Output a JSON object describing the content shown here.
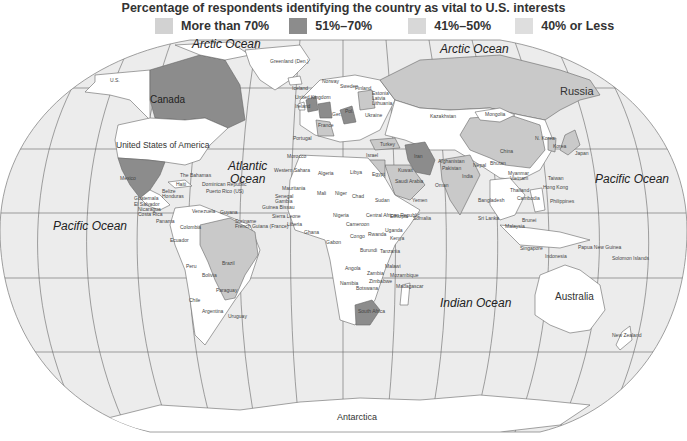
{
  "title": "Percentage of respondents identifying the country as vital to U.S. interests",
  "legend": [
    {
      "label": "More than 70%",
      "color": "#d2d2d2"
    },
    {
      "label": "51%–70%",
      "color": "#8c8c8c"
    },
    {
      "label": "41%–50%",
      "color": "#d8d8d8"
    },
    {
      "label": "40% or Less",
      "color": "#dedede"
    }
  ],
  "colors": {
    "ocean": "#ececec",
    "land": "#ffffff",
    "dark": "#8c8c8c",
    "light": "#c9c9c9",
    "grid": "#555555"
  },
  "oceans": {
    "arctic_w": "Arctic Ocean",
    "arctic_e": "Arctic Ocean",
    "atlantic_1": "Atlantic",
    "atlantic_2": "Ocean",
    "pacific_w": "Pacific Ocean",
    "pacific_e": "Pacific Ocean",
    "indian": "Indian Ocean"
  },
  "continents": {
    "antarctica": "Antarctica",
    "australia": "Australia"
  },
  "countries": {
    "canada": "Canada",
    "usa": "United States of America",
    "us_alaska": "U.S.",
    "russia": "Russia",
    "mexico": "Mexico",
    "brazil": "Brazil",
    "greenland": "Greenland (Den.)",
    "iceland": "Iceland",
    "norway": "Norway",
    "uk": "United Kingdom",
    "ireland": "Ireland",
    "france": "France",
    "portugal": "Portugal",
    "morocco": "Morocco",
    "algeria": "Algeria",
    "libya": "Libya",
    "egypt": "Egypt",
    "turkey": "Turkey",
    "iran": "Iran",
    "israel": "Israel",
    "saudi": "Saudi Arabia",
    "kuwait": "Kuwait",
    "oman": "Oman",
    "afghanistan": "Afghanistan",
    "pakistan": "Pakistan",
    "india": "India",
    "nepal": "Nepal",
    "bhutan": "Bhutan",
    "bangladesh": "Bangladesh",
    "sri_lanka": "Sri Lanka",
    "china": "China",
    "mongolia": "Mongolia",
    "kazakhstan": "Kazakhstan",
    "n_korea": "N. Korea",
    "s_korea": "Korea",
    "japan": "Japan",
    "taiwan": "Taiwan",
    "hong_kong": "Hong Kong",
    "myanmar": "Myanmar",
    "vietnam": "Vietnam",
    "thailand": "Thailand",
    "cambodia": "Cambodia",
    "philippines": "Philippines",
    "malaysia": "Malaysia",
    "brunei": "Brunei",
    "singapore": "Singapore",
    "indonesia": "Indonesia",
    "png": "Papua New Guinea",
    "solomon": "Solomon Islands",
    "new_zealand": "New Zealand",
    "bahamas": "The Bahamas",
    "cuba": "Cuba",
    "haiti": "Haiti",
    "dominican": "Dominican Republic",
    "puerto_rico": "Puerto Rico (US)",
    "belize": "Belize",
    "honduras": "Honduras",
    "guatemala": "Guatemala",
    "el_salvador": "El Salvador",
    "nicaragua": "Nicaragua",
    "costa_rica": "Costa Rica",
    "panama": "Panama",
    "venezuela": "Venezuela",
    "guyana": "Guyana",
    "suriname": "Suriname",
    "french_guiana": "French Guiana (France)",
    "colombia": "Colombia",
    "ecuador": "Ecuador",
    "peru": "Peru",
    "bolivia": "Bolivia",
    "paraguay": "Paraguay",
    "chile": "Chile",
    "argentina": "Argentina",
    "uruguay": "Uruguay",
    "western_sahara": "Western Sahara",
    "mauritania": "Mauritania",
    "senegal": "Senegal",
    "gambia": "Gambia",
    "guinea_bissau": "Guinea Bissau",
    "sierra_leone": "Sierra Leone",
    "liberia": "Liberia",
    "ivory_coast": "Ivory Coast",
    "ghana": "Ghana",
    "mali": "Mali",
    "niger": "Niger",
    "nigeria": "Nigeria",
    "chad": "Chad",
    "sudan": "Sudan",
    "ethiopia": "Ethiopia",
    "somalia": "Somalia",
    "car": "Central African Republic",
    "cameroon": "Cameroon",
    "gabon": "Gabon",
    "congo": "Congo",
    "rwanda": "Rwanda",
    "uganda": "Uganda",
    "kenya": "Kenya",
    "burundi": "Burundi",
    "tanzania": "Tanzania",
    "angola": "Angola",
    "zambia": "Zambia",
    "malawi": "Malawi",
    "mozambique": "Mozambique",
    "zimbabwe": "Zimbabwe",
    "namibia": "Namibia",
    "botswana": "Botswana",
    "south_africa": "South Africa",
    "madagascar": "Madagascar",
    "finland": "Finland",
    "sweden": "Sweden",
    "estonia": "Estonia",
    "latvia": "Latvia",
    "lithuania": "Lithuania",
    "poland": "Pol.",
    "germany": "Ger.",
    "ukraine": "Ukraine",
    "yemen": "Yemen"
  }
}
